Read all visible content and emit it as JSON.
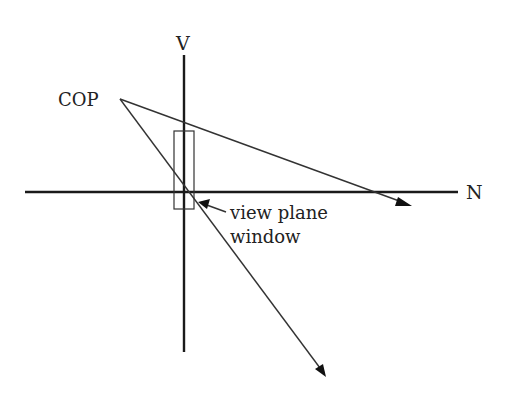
{
  "diagram": {
    "labels": {
      "vertical_axis": "V",
      "horizontal_axis": "N",
      "center_of_projection": "COP",
      "window_line1": "view plane",
      "window_line2": "window"
    },
    "colors": {
      "lines": "#1a1a1a",
      "text": "#222222",
      "background": "#ffffff"
    }
  }
}
